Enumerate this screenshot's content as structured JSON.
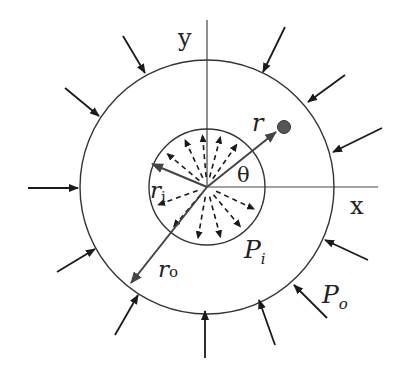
{
  "diagram": {
    "labels": {
      "y_axis": "y",
      "x_axis": "x",
      "radius_r": "r",
      "theta": "θ",
      "inner_radius": "r",
      "inner_radius_sub": "i",
      "outer_radius": "r",
      "outer_radius_sub": "o",
      "inner_pressure": "P",
      "inner_pressure_sub": "i",
      "outer_pressure": "P",
      "outer_pressure_sub": "o"
    },
    "geometry": {
      "center": [
        207,
        187
      ],
      "outer_radius_px": 127,
      "inner_radius_px": 58,
      "point": [
        283,
        127
      ]
    },
    "colors": {
      "line": "#333333",
      "arrow": "#1a1a1a",
      "point": "#555555",
      "background": "#ffffff"
    },
    "outer_pressure_arrows": [
      {
        "from": [
          123,
          36
        ],
        "to": [
          145,
          73
        ]
      },
      {
        "from": [
          65,
          88
        ],
        "to": [
          99,
          116
        ]
      },
      {
        "from": [
          28,
          188
        ],
        "to": [
          78,
          188
        ]
      },
      {
        "from": [
          57,
          272
        ],
        "to": [
          95,
          249
        ]
      },
      {
        "from": [
          115,
          335
        ],
        "to": [
          138,
          295
        ]
      },
      {
        "from": [
          205,
          358
        ],
        "to": [
          205,
          311
        ]
      },
      {
        "from": [
          275,
          345
        ],
        "to": [
          259,
          300
        ]
      },
      {
        "from": [
          327,
          318
        ],
        "to": [
          294,
          285
        ]
      },
      {
        "from": [
          368,
          260
        ],
        "to": [
          325,
          240
        ]
      },
      {
        "from": [
          382,
          128
        ],
        "to": [
          333,
          152
        ]
      },
      {
        "from": [
          345,
          75
        ],
        "to": [
          308,
          102
        ]
      },
      {
        "from": [
          285,
          27
        ],
        "to": [
          263,
          72
        ]
      }
    ],
    "inner_pressure_arrow_angles_deg": [
      95,
      75,
      115,
      140,
      55,
      200,
      230,
      260,
      285,
      310,
      335
    ]
  }
}
